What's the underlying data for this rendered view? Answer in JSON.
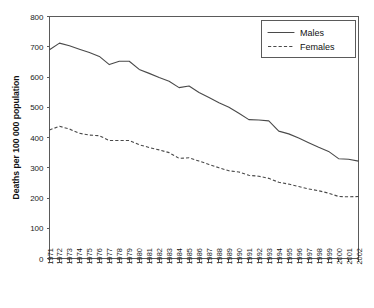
{
  "chart_data": {
    "type": "line",
    "title": "",
    "xlabel": "",
    "ylabel": "Deaths per 100 000 population",
    "ylim": [
      0,
      800
    ],
    "ytick_values": [
      0,
      100,
      200,
      300,
      400,
      500,
      600,
      700,
      800
    ],
    "ytick_labels": [
      "0",
      "100",
      "200",
      "300",
      "400",
      "500",
      "600",
      "700",
      "800"
    ],
    "grid": false,
    "legend_position": "top-right",
    "legend_entries": [
      {
        "label": "Males",
        "style": "solid"
      },
      {
        "label": "Females",
        "style": "dashed"
      }
    ],
    "categories": [
      "1971",
      "1972",
      "1973",
      "1974",
      "1975",
      "1976",
      "1977",
      "1978",
      "1979",
      "1980",
      "1981",
      "1982",
      "1983",
      "1984",
      "1985",
      "1986",
      "1987",
      "1988",
      "1989",
      "1990",
      "1991",
      "1992",
      "1993",
      "1994",
      "1995",
      "1996",
      "1997",
      "1998",
      "1999",
      "2000",
      "2001",
      "2002"
    ],
    "series": [
      {
        "name": "Males",
        "style": "solid",
        "values": [
          690,
          712,
          703,
          692,
          681,
          668,
          641,
          652,
          652,
          625,
          612,
          598,
          586,
          565,
          570,
          549,
          532,
          515,
          500,
          480,
          459,
          458,
          455,
          421,
          412,
          398,
          383,
          368,
          354,
          330,
          328,
          322
        ]
      },
      {
        "name": "Females",
        "style": "dashed",
        "values": [
          425,
          437,
          428,
          414,
          408,
          406,
          390,
          390,
          390,
          376,
          367,
          359,
          350,
          331,
          333,
          322,
          311,
          300,
          290,
          286,
          275,
          272,
          265,
          252,
          246,
          238,
          230,
          224,
          216,
          205,
          204,
          205
        ]
      }
    ]
  }
}
